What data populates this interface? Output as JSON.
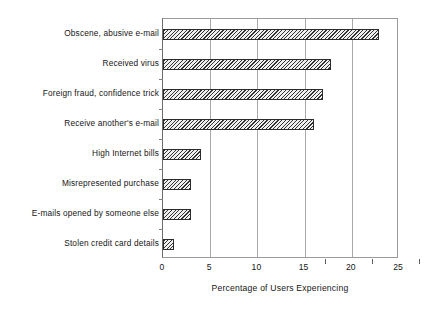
{
  "chart_data": {
    "type": "bar",
    "orientation": "horizontal",
    "title": "",
    "xlabel": "Percentage of Users Experiencing",
    "ylabel": "",
    "xlim": [
      0,
      25
    ],
    "xticks": [
      "0",
      "5",
      "10",
      "15",
      "20",
      "25"
    ],
    "grid": "vertical",
    "legend": "none",
    "categories": [
      "Obscene, abusive e-mail",
      "Received virus",
      "Foreign fraud, confidence trick",
      "Receive another's e-mail",
      "High Internet bills",
      "Misrepresented purchase",
      "E-mails opened by someone else",
      "Stolen credit card details"
    ],
    "values": [
      22.9,
      17.8,
      17.0,
      16.0,
      4.0,
      3.0,
      3.0,
      1.2
    ],
    "bar_style": {
      "fill": "diagonal-hatch",
      "border_color": "#2b2b2b",
      "hatch_color": "#333333",
      "background_color": "#efefef"
    },
    "axis_color": "#6d6d6d",
    "gridline_color": "#a9a9a9"
  }
}
